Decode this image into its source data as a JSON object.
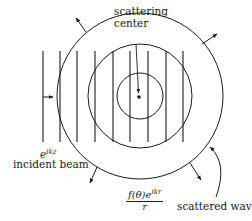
{
  "diagram": {
    "labels": {
      "scattering_center_line1": "scattering",
      "scattering_center_line2": "center",
      "incident_wave_base": "e",
      "incident_wave_exponent": "ikz",
      "incident_beam": "incident beam",
      "scattered_numerator_base": "f(θ)e",
      "scattered_numerator_exponent": "ikr",
      "scattered_denominator": "r",
      "scattered_wave": "scattered wave"
    },
    "geometry": {
      "center": [
        140,
        96
      ],
      "circle_radii": [
        23,
        52,
        83
      ],
      "wavefront_x": [
        43,
        60,
        77,
        95,
        113,
        130,
        148,
        166,
        183
      ],
      "wavefront_y_range": [
        51,
        142
      ]
    },
    "colors": {
      "ink": "#1a1a1a",
      "background": "#ffffff"
    }
  }
}
